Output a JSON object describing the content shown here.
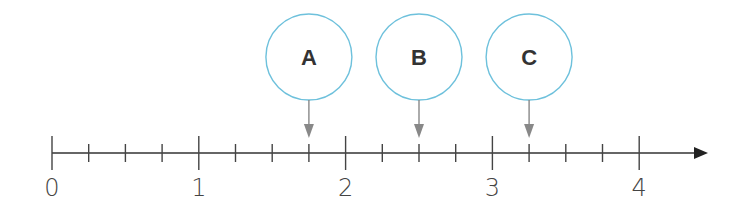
{
  "diagram": {
    "type": "number-line",
    "range": [
      0,
      4
    ],
    "subdivisions_per_unit": 4,
    "colors": {
      "axis": "#333333",
      "circle_stroke": "#6ec1dc",
      "pointer_arrow": "#888888",
      "label_text": "#333333"
    },
    "major_labels": [
      "0",
      "1",
      "2",
      "3",
      "4"
    ],
    "markers": [
      {
        "label": "A",
        "value": 1.75
      },
      {
        "label": "B",
        "value": 2.5
      },
      {
        "label": "C",
        "value": 3.25
      }
    ]
  }
}
